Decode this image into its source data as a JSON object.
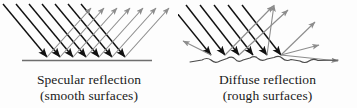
{
  "figure": {
    "background_color": "#fdfdfd",
    "incoming_ray_color": "#111111",
    "outgoing_ray_color": "#8c8c8c",
    "surface_color": "#6e6e6e",
    "text_color": "#1a1a1a"
  },
  "panels": [
    {
      "id": "specular",
      "caption_line1": "Specular reflection",
      "caption_line2": "(smooth surfaces)",
      "surface_type": "smooth",
      "incoming_ray_count": 7,
      "outgoing_ray_count": 6,
      "incoming_ray_label": "incident-ray",
      "outgoing_ray_label": "reflected-ray",
      "surface_label": "smooth-surface-line"
    },
    {
      "id": "diffuse",
      "caption_line1": "Diffuse reflection",
      "caption_line2": "(rough surfaces)",
      "surface_type": "rough",
      "incoming_ray_count": 6,
      "outgoing_ray_count": 6,
      "incoming_ray_label": "incident-ray",
      "outgoing_ray_label": "scattered-ray",
      "surface_label": "rough-surface-line"
    }
  ]
}
